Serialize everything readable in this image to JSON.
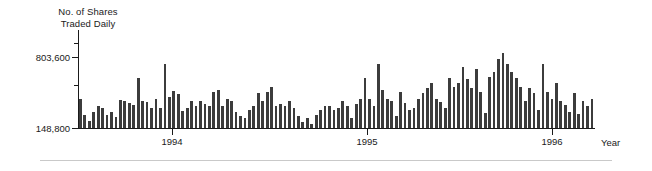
{
  "chart_data": {
    "type": "bar",
    "title": "",
    "ylabel": "No. of Shares\nTraded Daily",
    "ylabel_line1": "No. of Shares",
    "ylabel_line2": "Traded Daily",
    "xlabel": "Year",
    "ytick_labels": [
      "803,600",
      "148,800"
    ],
    "ytick_values": [
      803600,
      148800
    ],
    "yminor_ticks": 2,
    "ylim": [
      148800,
      1050000
    ],
    "xtick_labels": [
      "1994",
      "1995",
      "1996"
    ],
    "xtick_positions": [
      172,
      367,
      552
    ],
    "grid": false,
    "legend": null,
    "bar_color": "#3c3c3c",
    "axis_color": "#1a1a1a",
    "n_bars": 116,
    "values": [
      420000,
      268000,
      212000,
      300000,
      352000,
      330000,
      268000,
      292000,
      252000,
      402000,
      400000,
      382000,
      362000,
      612000,
      398000,
      386000,
      330000,
      420000,
      330000,
      742000,
      436000,
      486000,
      462000,
      306000,
      330000,
      398000,
      352000,
      398000,
      372000,
      352000,
      478000,
      500000,
      352000,
      420000,
      396000,
      300000,
      258000,
      238000,
      310000,
      352000,
      468000,
      400000,
      478000,
      530000,
      352000,
      372000,
      352000,
      400000,
      330000,
      258000,
      200000,
      238000,
      186000,
      268000,
      312000,
      352000,
      352000,
      316000,
      330000,
      400000,
      348000,
      240000,
      372000,
      420000,
      612000,
      420000,
      350000,
      736000,
      500000,
      420000,
      400000,
      260000,
      478000,
      380000,
      310000,
      330000,
      420000,
      468000,
      520000,
      566000,
      420000,
      390000,
      330000,
      612000,
      530000,
      560000,
      710000,
      600000,
      520000,
      692000,
      478000,
      288000,
      620000,
      660000,
      780000,
      840000,
      740000,
      660000,
      612000,
      530000,
      400000,
      520000,
      470000,
      310000,
      742000,
      478000,
      420000,
      560000,
      400000,
      360000,
      300000,
      470000,
      282000,
      398000,
      352000,
      420000
    ]
  }
}
